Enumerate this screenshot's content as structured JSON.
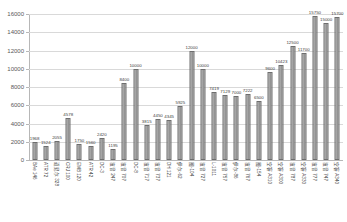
{
  "chart_data": {
    "type": "bar",
    "title": "",
    "subtitle": "",
    "xlabel": "",
    "ylabel": "",
    "ylim": [
      0,
      16000
    ],
    "ytick_step": 2000,
    "yticks": [
      "0",
      "2000",
      "4000",
      "6000",
      "8000",
      "10000",
      "12000",
      "14000",
      "16000"
    ],
    "grid": true,
    "legend": "none",
    "bar_color": "#8c8c8c",
    "bar_border_color": "#6e6e6e",
    "axis_color": "#b7b7b7",
    "gridline_color": "#d9d9d9",
    "label_color": "#404040",
    "categories": [
      "BAe 146",
      "ATR 72",
      "道尼尔 328",
      "CRJ 100",
      "EMB 120",
      "ATR 42",
      "DC-3",
      "波音 247",
      "波音 707",
      "DC-8",
      "波音 717",
      "波音 737",
      "DH 121",
      "伊尔-62",
      "图-104",
      "波音 727",
      "L-1011",
      "波音 757",
      "伊尔-86",
      "波音 767",
      "图-154",
      "空客 A310",
      "空客 A300",
      "波音 787",
      "空客 A330",
      "波音 777",
      "波音 747",
      "空客 A340"
    ],
    "values": [
      1968,
      1524,
      2055,
      4578,
      1750,
      1560,
      2420,
      1195,
      8400,
      10000,
      3815,
      4450,
      4345,
      5925,
      12000,
      10000,
      7419,
      7129,
      7000,
      7222,
      6500,
      9600,
      10423,
      12500,
      11700,
      15750,
      15000,
      15700
    ],
    "value_labels": [
      "1968",
      "1524",
      "2055",
      "4578",
      "1750",
      "1560",
      "2420",
      "1195",
      "8400",
      "10000",
      "3815",
      "4450",
      "4345",
      "5925",
      "12000",
      "10000",
      "7419",
      "7129",
      "7000",
      "7222",
      "6500",
      "9600",
      "10423",
      "12500",
      "11700",
      "15750",
      "15000",
      "15700"
    ]
  }
}
